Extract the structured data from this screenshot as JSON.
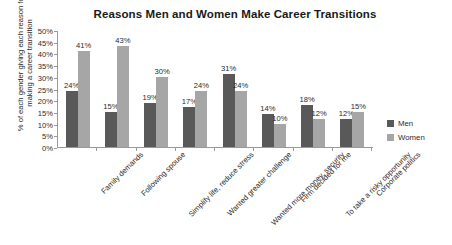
{
  "chart_data": {
    "type": "bar",
    "title": "Reasons Men and Women Make Career Transitions",
    "xlabel": "",
    "ylabel_lines": [
      "% of each gender giving each reason for",
      "making a career transition"
    ],
    "ylabel": "% of each gender giving each reason for making a career transition",
    "ylim": [
      0,
      50
    ],
    "ytick_labels": [
      "50%",
      "45%",
      "40%",
      "35%",
      "30%",
      "25%",
      "20%",
      "15%",
      "10%",
      "5%",
      "0%"
    ],
    "ytick_values": [
      50,
      45,
      40,
      35,
      30,
      25,
      20,
      15,
      10,
      5,
      0
    ],
    "grid": false,
    "legend_position": "right",
    "categories": [
      "Family demands",
      "Following spouse",
      "Simplify life, reduce stress",
      "Wanted greater challenge",
      "Wanted more money, security",
      "Firm decided for me",
      "To take a risky opportunity",
      "Corporate politics"
    ],
    "series": [
      {
        "name": "Men",
        "color": "#595959",
        "values": [
          24,
          15,
          19,
          17,
          31,
          14,
          18,
          12
        ],
        "labels": [
          "24%",
          "15%",
          "19%",
          "17%",
          "31%",
          "14%",
          "18%",
          "12%"
        ]
      },
      {
        "name": "Women",
        "color": "#a6a6a6",
        "values": [
          41,
          43,
          30,
          24,
          24,
          10,
          12,
          15
        ],
        "labels": [
          "41%",
          "43%",
          "30%",
          "24%",
          "24%",
          "10%",
          "12%",
          "15%"
        ]
      }
    ]
  },
  "legend": {
    "items": [
      {
        "label": "Men"
      },
      {
        "label": "Women"
      }
    ]
  }
}
